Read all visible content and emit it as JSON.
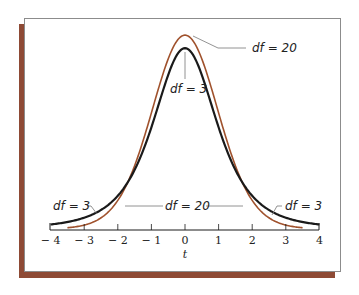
{
  "chart_data": {
    "type": "line",
    "title": "",
    "xlabel": "t",
    "ylabel": "",
    "xlim": [
      -4,
      4
    ],
    "ylim": [
      0,
      0.4
    ],
    "grid": false,
    "x_ticks": [
      -4,
      -3,
      -2,
      -1,
      0,
      1,
      2,
      3,
      4
    ],
    "x_tick_labels": [
      "− 4",
      "− 3",
      "− 2",
      "− 1",
      "0",
      "1",
      "2",
      "3",
      "4"
    ],
    "series": [
      {
        "name": "df = 3",
        "color": "#1a1a1a",
        "distribution": "Student t, 3 degrees of freedom",
        "x": [
          -4,
          -3,
          -2,
          -1,
          0,
          1,
          2,
          3,
          4
        ],
        "values": [
          0.0092,
          0.023,
          0.0675,
          0.2067,
          0.3676,
          0.2067,
          0.0675,
          0.023,
          0.0092
        ]
      },
      {
        "name": "df = 20",
        "color": "#a0522d",
        "distribution": "Student t, 20 degrees of freedom",
        "x": [
          -3.5,
          -3,
          -2,
          -1,
          0,
          1,
          2,
          3,
          3.5
        ],
        "values": [
          0.0019,
          0.0058,
          0.0574,
          0.236,
          0.394,
          0.236,
          0.0574,
          0.0058,
          0.0019
        ]
      }
    ],
    "annotations": [
      {
        "text": "df = 20",
        "points_to": "df = 20 peak"
      },
      {
        "text": "df = 3",
        "points_to": "df = 3 peak"
      },
      {
        "text": "df = 3",
        "points_to": "df = 3 left tail"
      },
      {
        "text": "df = 20",
        "points_to": "df = 20 flanks (both sides)"
      },
      {
        "text": "df = 3",
        "points_to": "df = 3 right tail"
      }
    ],
    "legend": "none (inline labels)"
  },
  "labels": {
    "peak_df20": "df = 20",
    "peak_df3": "df = 3",
    "tail_left_df3": "df = 3",
    "middle_df20": "df = 20",
    "tail_right_df3": "df = 3",
    "x_axis": "t"
  },
  "colors": {
    "df3_curve": "#1a1a1a",
    "df20_curve": "#a0522d",
    "frame_shadow": "#8e4a35",
    "frame_border": "#8c8c8c"
  }
}
